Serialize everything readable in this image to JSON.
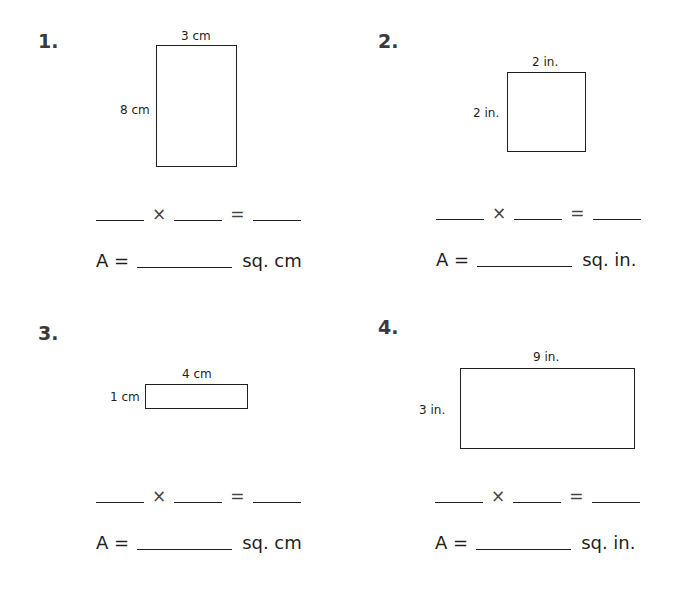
{
  "problems": [
    {
      "number": "1.",
      "width_label": "3 cm",
      "height_label": "8 cm",
      "times": "×",
      "equals": "=",
      "area_prefix": "A =",
      "area_unit": "sq. cm"
    },
    {
      "number": "2.",
      "width_label": "2 in.",
      "height_label": "2 in.",
      "times": "×",
      "equals": "=",
      "area_prefix": "A =",
      "area_unit": "sq. in."
    },
    {
      "number": "3.",
      "width_label": "4 cm",
      "height_label": "1 cm",
      "times": "×",
      "equals": "=",
      "area_prefix": "A =",
      "area_unit": "sq. cm"
    },
    {
      "number": "4.",
      "width_label": "9 in.",
      "height_label": "3 in.",
      "times": "×",
      "equals": "=",
      "area_prefix": "A =",
      "area_unit": "sq. in."
    }
  ]
}
